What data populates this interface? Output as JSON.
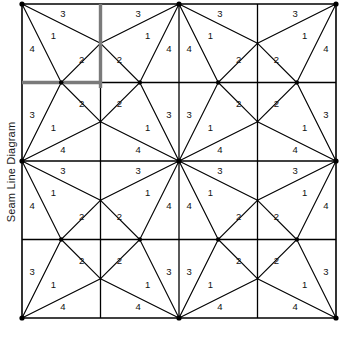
{
  "axis": {
    "label": "Seam Line Diagram"
  },
  "colors": {
    "line": "#000000",
    "highlight": "#7a7a7a",
    "background": "#ffffff",
    "text": "#111111"
  },
  "diagram": {
    "type": "seam-line-grid",
    "grid": {
      "cols": 4,
      "rows": 4,
      "x0": 22,
      "y0": 4,
      "cell": 78.5
    },
    "region_labels": [
      "1",
      "2",
      "3",
      "4"
    ],
    "cell_pattern": {
      "description": "Each cell is divided by seam lines into four numbered regions 1,2,3,4",
      "regions": [
        {
          "id": "1",
          "label": "1"
        },
        {
          "id": "2",
          "label": "2"
        },
        {
          "id": "3",
          "label": "3"
        },
        {
          "id": "4",
          "label": "4"
        }
      ]
    },
    "highlight": {
      "vertical": {
        "x": 100.5,
        "y1": 4,
        "y2": 88
      },
      "horizontal": {
        "y": 82.5,
        "x1": 22,
        "x2": 101
      }
    }
  },
  "chart_data": {
    "type": "diagram",
    "title": "Seam Line Diagram",
    "ylabel": "Seam Line Diagram",
    "grid": true,
    "rows": 4,
    "cols": 4,
    "cells": [
      {
        "row": 0,
        "col": 0,
        "orient": "tl",
        "labels": [
          "4",
          "3",
          "1",
          "2"
        ]
      },
      {
        "row": 0,
        "col": 1,
        "orient": "tr",
        "labels": [
          "4",
          "3",
          "1",
          "2"
        ]
      },
      {
        "row": 0,
        "col": 2,
        "orient": "tl",
        "labels": [
          "4",
          "3",
          "1",
          "2"
        ]
      },
      {
        "row": 0,
        "col": 3,
        "orient": "tr",
        "labels": [
          "4",
          "3",
          "1",
          "2"
        ]
      },
      {
        "row": 1,
        "col": 0,
        "orient": "bl",
        "labels": [
          "3",
          "4",
          "1",
          "2"
        ]
      },
      {
        "row": 1,
        "col": 1,
        "orient": "br",
        "labels": [
          "3",
          "4",
          "1",
          "2"
        ]
      },
      {
        "row": 1,
        "col": 2,
        "orient": "bl",
        "labels": [
          "3",
          "4",
          "1",
          "2"
        ]
      },
      {
        "row": 1,
        "col": 3,
        "orient": "br",
        "labels": [
          "3",
          "4",
          "1",
          "2"
        ]
      },
      {
        "row": 2,
        "col": 0,
        "orient": "tl",
        "labels": [
          "4",
          "3",
          "1",
          "2"
        ]
      },
      {
        "row": 2,
        "col": 1,
        "orient": "tr",
        "labels": [
          "4",
          "3",
          "1",
          "2"
        ]
      },
      {
        "row": 2,
        "col": 2,
        "orient": "tl",
        "labels": [
          "4",
          "3",
          "1",
          "2"
        ]
      },
      {
        "row": 2,
        "col": 3,
        "orient": "tr",
        "labels": [
          "4",
          "3",
          "1",
          "2"
        ]
      },
      {
        "row": 3,
        "col": 0,
        "orient": "bl",
        "labels": [
          "3",
          "4",
          "1",
          "2"
        ]
      },
      {
        "row": 3,
        "col": 1,
        "orient": "br",
        "labels": [
          "3",
          "4",
          "1",
          "2"
        ]
      },
      {
        "row": 3,
        "col": 2,
        "orient": "bl",
        "labels": [
          "3",
          "4",
          "1",
          "2"
        ]
      },
      {
        "row": 3,
        "col": 3,
        "orient": "br",
        "labels": [
          "3",
          "4",
          "1",
          "2"
        ]
      }
    ]
  }
}
